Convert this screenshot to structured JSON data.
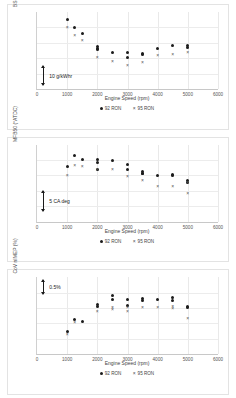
{
  "figure": {
    "background": "#ffffff",
    "series_colors": {
      "92 RON": "#1b1b1b",
      "95 RON": "#4d4d4d"
    }
  },
  "panels": [
    {
      "id": "bsfc",
      "ylabel": "BSFC (g/kWh)",
      "xlabel": "Engine Speed (rpm)",
      "xticks": [
        "0",
        "1000",
        "2000",
        "3000",
        "4000",
        "5000",
        "6000"
      ],
      "legend": [
        {
          "label": "92 RON",
          "marker": "filled-circle"
        },
        {
          "label": "95 RON",
          "marker": "cross"
        }
      ],
      "scalebar": {
        "text": "10 g/kWhr"
      }
    },
    {
      "id": "mfb50",
      "ylabel": "MFB50 (°ATDC)",
      "xlabel": "Engine Speed (rpm)",
      "xticks": [
        "0",
        "1000",
        "2000",
        "3000",
        "4000",
        "5000",
        "6000"
      ],
      "legend": [
        {
          "label": "92 RON",
          "marker": "filled-circle"
        },
        {
          "label": "95 RON",
          "marker": "cross"
        }
      ],
      "scalebar": {
        "text": "5 CA deg"
      }
    },
    {
      "id": "cov-nimep",
      "ylabel": "CoV nIMEP (%)",
      "xlabel": "Engine Speed (rpm)",
      "xticks": [
        "0",
        "1000",
        "2000",
        "3000",
        "4000",
        "5000",
        "6000"
      ],
      "legend": [
        {
          "label": "92 RON",
          "marker": "filled-circle"
        },
        {
          "label": "95 RON",
          "marker": "cross"
        }
      ],
      "scalebar": {
        "text": "0.5%"
      }
    }
  ],
  "chart_data": [
    {
      "type": "scatter",
      "title": "",
      "xlabel": "Engine Speed (rpm)",
      "ylabel": "BSFC (g/kWh)",
      "xlim": [
        0,
        6000
      ],
      "ylim": [
        0,
        100
      ],
      "ytick_labels": [],
      "grid": true,
      "legend_position": "bottom",
      "annotation": {
        "text": "10 g/kWhr",
        "type": "scale-bar",
        "value": 10,
        "units": "g/kWhr"
      },
      "series": [
        {
          "name": "92 RON",
          "marker": "filled-circle",
          "points": [
            [
              1000,
              90
            ],
            [
              1250,
              80
            ],
            [
              1500,
              72
            ],
            [
              2000,
              55
            ],
            [
              2000,
              53
            ],
            [
              2000,
              51
            ],
            [
              2500,
              48
            ],
            [
              3000,
              47
            ],
            [
              3000,
              41
            ],
            [
              3500,
              46
            ],
            [
              3500,
              45
            ],
            [
              4000,
              52
            ],
            [
              4500,
              56
            ],
            [
              5000,
              56
            ],
            [
              5000,
              54
            ]
          ]
        },
        {
          "name": "95 RON",
          "marker": "cross",
          "points": [
            [
              1000,
              80
            ],
            [
              1250,
              70
            ],
            [
              1500,
              63
            ],
            [
              2000,
              41
            ],
            [
              2500,
              36
            ],
            [
              3000,
              31
            ],
            [
              3500,
              35
            ],
            [
              4000,
              43
            ],
            [
              4500,
              45
            ],
            [
              5000,
              48
            ]
          ]
        }
      ]
    },
    {
      "type": "scatter",
      "title": "",
      "xlabel": "Engine Speed (rpm)",
      "ylabel": "MFB50 (°ATDC)",
      "xlim": [
        0,
        6000
      ],
      "ylim": [
        0,
        100
      ],
      "ytick_labels": [],
      "grid": true,
      "legend_position": "bottom",
      "annotation": {
        "text": "5 CA deg",
        "type": "scale-bar",
        "value": 5,
        "units": "CA deg"
      },
      "series": [
        {
          "name": "92 RON",
          "marker": "filled-circle",
          "points": [
            [
              1000,
              72
            ],
            [
              1250,
              86
            ],
            [
              1500,
              80
            ],
            [
              2000,
              80
            ],
            [
              2000,
              77
            ],
            [
              2000,
              68
            ],
            [
              2500,
              79
            ],
            [
              3000,
              74
            ],
            [
              3000,
              68
            ],
            [
              3500,
              65
            ],
            [
              3500,
              63
            ],
            [
              3500,
              62
            ],
            [
              4000,
              60
            ],
            [
              4500,
              61
            ],
            [
              4500,
              60
            ],
            [
              5000,
              53
            ],
            [
              5000,
              51
            ]
          ]
        },
        {
          "name": "95 RON",
          "marker": "cross",
          "points": [
            [
              1000,
              60
            ],
            [
              1250,
              73
            ],
            [
              1500,
              72
            ],
            [
              2000,
              68
            ],
            [
              2500,
              68
            ],
            [
              3000,
              58
            ],
            [
              3500,
              54
            ],
            [
              4000,
              46
            ],
            [
              4500,
              45
            ],
            [
              5000,
              51
            ],
            [
              5000,
              36
            ]
          ]
        }
      ]
    },
    {
      "type": "scatter",
      "title": "",
      "xlabel": "Engine Speed (rpm)",
      "ylabel": "CoV nIMEP (%)",
      "xlim": [
        0,
        6000
      ],
      "ylim": [
        0,
        100
      ],
      "ytick_labels": [],
      "grid": true,
      "legend_position": "bottom",
      "annotation": {
        "text": "0.5%",
        "type": "scale-bar",
        "value": 0.5,
        "units": "%"
      },
      "series": [
        {
          "name": "92 RON",
          "marker": "filled-circle",
          "points": [
            [
              1000,
              30
            ],
            [
              1250,
              45
            ],
            [
              1500,
              42
            ],
            [
              2000,
              65
            ],
            [
              2000,
              62
            ],
            [
              2500,
              76
            ],
            [
              2500,
              71
            ],
            [
              3000,
              71
            ],
            [
              3000,
              63
            ],
            [
              3500,
              72
            ],
            [
              3500,
              70
            ],
            [
              4000,
              71
            ],
            [
              4500,
              73
            ],
            [
              4500,
              70
            ],
            [
              5000,
              62
            ],
            [
              5000,
              60
            ]
          ]
        },
        {
          "name": "95 RON",
          "marker": "cross",
          "points": [
            [
              1000,
              26
            ],
            [
              1250,
              41
            ],
            [
              2000,
              56
            ],
            [
              2500,
              60
            ],
            [
              2500,
              58
            ],
            [
              3000,
              60
            ],
            [
              3000,
              55
            ],
            [
              3500,
              60
            ],
            [
              4000,
              60
            ],
            [
              4500,
              62
            ],
            [
              4500,
              59
            ],
            [
              5000,
              46
            ]
          ]
        }
      ]
    }
  ]
}
